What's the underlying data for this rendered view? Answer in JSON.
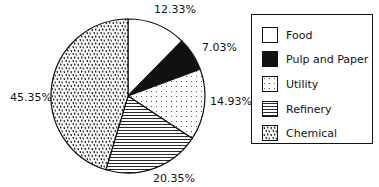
{
  "chart_data": {
    "type": "pie",
    "title": "",
    "categories": [
      "Food",
      "Pulp and Paper",
      "Utility",
      "Refinery",
      "Chemical"
    ],
    "values": [
      12.33,
      7.03,
      14.93,
      20.35,
      45.35
    ],
    "labels": [
      "12.33%",
      "7.03%",
      "14.93%",
      "20.35%",
      "45.35%"
    ],
    "patterns": [
      "white",
      "black",
      "dots",
      "horizontal-lines",
      "dashes"
    ],
    "legend_position": "right",
    "start_angle": "12 o'clock, clockwise"
  },
  "legend": {
    "items": [
      {
        "label": "Food"
      },
      {
        "label": "Pulp and Paper"
      },
      {
        "label": "Utility"
      },
      {
        "label": "Refinery"
      },
      {
        "label": "Chemical"
      }
    ]
  }
}
